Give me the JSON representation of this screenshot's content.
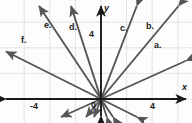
{
  "figure": {
    "type": "coordinate-plane-line-graph",
    "stroke_color": "#555555",
    "axis_color": "#1a1a1a",
    "grid_color": "#e3e3e3",
    "background": "#fdfdfd"
  },
  "axes": {
    "x_label": "x",
    "y_label": "y",
    "origin_label": "0",
    "x_ticks": [
      {
        "value": -4,
        "label": "-4",
        "px": 38
      },
      {
        "value": 4,
        "label": "4",
        "px": 152
      }
    ],
    "y_ticks": [
      {
        "value": 4,
        "label": "4",
        "px": 35
      }
    ],
    "origin_px": {
      "x": 101,
      "y": 99
    },
    "unit_px": 12.8,
    "xlim": [
      -7.8,
      7.1
    ],
    "ylim": [
      -1.9,
      7.7
    ]
  },
  "lines": [
    {
      "id": "a",
      "label": "a.",
      "slope": 0.45,
      "label_px": {
        "x": 154,
        "y": 41
      }
    },
    {
      "id": "b",
      "label": "b.",
      "slope": 1.2,
      "label_px": {
        "x": 146,
        "y": 22
      }
    },
    {
      "id": "c",
      "label": "c.",
      "slope": 2.6,
      "label_px": {
        "x": 120,
        "y": 24
      }
    },
    {
      "id": "d",
      "label": "d.",
      "slope": -3.1,
      "label_px": {
        "x": 69,
        "y": 23
      }
    },
    {
      "id": "e",
      "label": "e.",
      "slope": -1.5,
      "label_px": {
        "x": 44,
        "y": 21
      }
    },
    {
      "id": "f",
      "label": "f.",
      "slope": -0.5,
      "label_px": {
        "x": 21,
        "y": 36
      }
    }
  ],
  "chart_data": {
    "type": "line",
    "title": "",
    "xlabel": "x",
    "ylabel": "y",
    "grid": true,
    "legend": "inline-labels",
    "xlim": [
      -7.8,
      7.1
    ],
    "ylim": [
      -1.9,
      7.7
    ],
    "xticks": [
      -4,
      4
    ],
    "xticklabels": [
      "-4",
      "4"
    ],
    "yticks": [
      4
    ],
    "yticklabels": [
      "4"
    ],
    "series": [
      {
        "name": "a.",
        "equation": "y = 0.45x",
        "slope": 0.45,
        "intercept": 0
      },
      {
        "name": "b.",
        "equation": "y = 1.2x",
        "slope": 1.2,
        "intercept": 0
      },
      {
        "name": "c.",
        "equation": "y = 2.6x",
        "slope": 2.6,
        "intercept": 0
      },
      {
        "name": "d.",
        "equation": "y = -3.1x",
        "slope": -3.1,
        "intercept": 0
      },
      {
        "name": "e.",
        "equation": "y = -1.5x",
        "slope": -1.5,
        "intercept": 0
      },
      {
        "name": "f.",
        "equation": "y = -0.5x",
        "slope": -0.5,
        "intercept": 0
      }
    ],
    "annotations": [
      "a.",
      "b.",
      "c.",
      "d.",
      "e.",
      "f.",
      "x",
      "y",
      "0",
      "4",
      "-4"
    ]
  }
}
